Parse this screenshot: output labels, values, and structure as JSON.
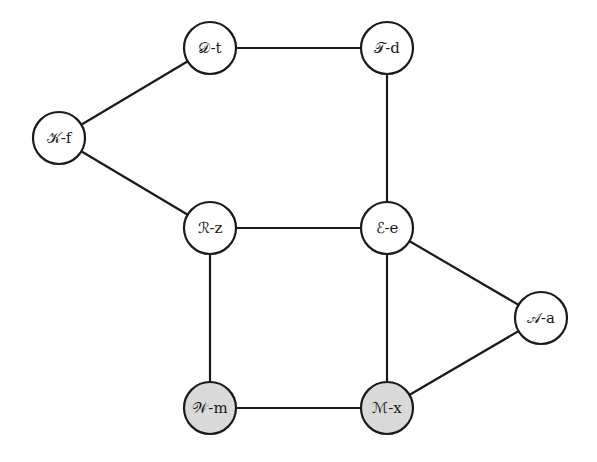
{
  "graph": {
    "colors": {
      "default_fill": "#ffffff",
      "highlight_fill": "#d9d9d9",
      "stroke": "#1a1a1a"
    },
    "nodes": [
      {
        "id": "D-t",
        "symbol": "𝒟",
        "sub": "t",
        "x": 210,
        "y": 48,
        "highlighted": false
      },
      {
        "id": "T-d",
        "symbol": "𝒯",
        "sub": "d",
        "x": 387,
        "y": 48,
        "highlighted": false
      },
      {
        "id": "K-f",
        "symbol": "𝒦",
        "sub": "f",
        "x": 59,
        "y": 138,
        "highlighted": false
      },
      {
        "id": "R-z",
        "symbol": "ℛ",
        "sub": "z",
        "x": 210,
        "y": 228,
        "highlighted": false
      },
      {
        "id": "E-e",
        "symbol": "ℰ",
        "sub": "e",
        "x": 387,
        "y": 228,
        "highlighted": false
      },
      {
        "id": "A-a",
        "symbol": "𝒜",
        "sub": "a",
        "x": 541,
        "y": 318,
        "highlighted": false
      },
      {
        "id": "W-m",
        "symbol": "𝒲",
        "sub": "m",
        "x": 210,
        "y": 408,
        "highlighted": true
      },
      {
        "id": "M-x",
        "symbol": "ℳ",
        "sub": "x",
        "x": 387,
        "y": 408,
        "highlighted": true
      }
    ],
    "edges": [
      [
        "D-t",
        "T-d"
      ],
      [
        "K-f",
        "D-t"
      ],
      [
        "K-f",
        "R-z"
      ],
      [
        "T-d",
        "E-e"
      ],
      [
        "R-z",
        "E-e"
      ],
      [
        "R-z",
        "W-m"
      ],
      [
        "E-e",
        "M-x"
      ],
      [
        "E-e",
        "A-a"
      ],
      [
        "A-a",
        "M-x"
      ],
      [
        "W-m",
        "M-x"
      ]
    ],
    "labels": {
      "D-t": "𝒟-t",
      "T-d": "𝒯-d",
      "K-f": "𝒦-f",
      "R-z": "ℛ-z",
      "E-e": "ℰ-e",
      "A-a": "𝒜-a",
      "W-m": "𝒲-m",
      "M-x": "ℳ-x"
    }
  }
}
